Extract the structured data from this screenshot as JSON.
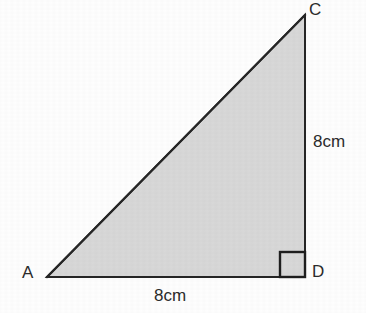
{
  "figure": {
    "kind": "right-triangle-diagram",
    "shape_name": "triangle ACD",
    "fill_color": "#d8d8d8",
    "stroke_color": "#262626",
    "background_color": "#fefefe",
    "stroke_width": 2,
    "vertices": [
      {
        "name": "A",
        "label": "A",
        "x": 47,
        "y": 277
      },
      {
        "name": "C",
        "label": "C",
        "x": 305,
        "y": 15
      },
      {
        "name": "D",
        "label": "D",
        "x": 305,
        "y": 277
      }
    ],
    "vertex_labels": {
      "A": "A",
      "C": "C",
      "D": "D"
    },
    "side_labels": {
      "vertical_cd": "8cm",
      "horizontal_ad": "8cm"
    },
    "right_angle": {
      "at_vertex": "D",
      "marker": "square",
      "size": 25
    }
  }
}
